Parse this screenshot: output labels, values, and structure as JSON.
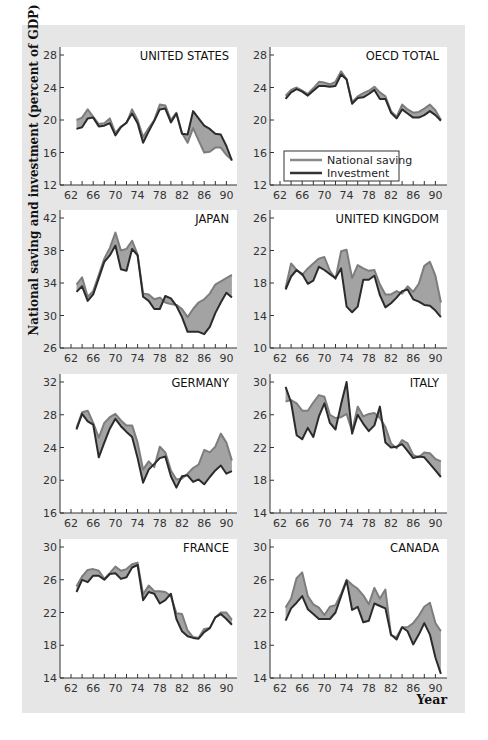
{
  "chart_data": {
    "type": "line",
    "subtype": "small-multiples-band",
    "ylabel": "National saving and investment (percent of GDP)",
    "xlabel": "Year",
    "legend": {
      "entries": [
        {
          "name": "National saving",
          "color": "#8a8a8a"
        },
        {
          "name": "Investment",
          "color": "#333333"
        }
      ],
      "panel": "OECD TOTAL"
    },
    "colors": {
      "band_fill": "#a3a3a3",
      "saving_line": "#7d7d7d",
      "investment_line": "#2b2b2b",
      "background": "#e6e6e6",
      "plot_bg": "#ffffff"
    },
    "x": [
      63,
      64,
      65,
      66,
      67,
      68,
      69,
      70,
      71,
      72,
      73,
      74,
      75,
      76,
      77,
      78,
      79,
      80,
      81,
      82,
      83,
      84,
      85,
      86,
      87,
      88,
      89,
      90,
      91
    ],
    "x_ticks": [
      "62",
      "66",
      "70",
      "74",
      "78",
      "82",
      "86",
      "90"
    ],
    "panels": [
      {
        "title": "UNITED STATES",
        "ylim": [
          12,
          28
        ],
        "yticks": [
          12,
          16,
          20,
          24,
          28
        ],
        "series": [
          {
            "name": "National saving",
            "values": [
              20.0,
              20.3,
              21.3,
              20.4,
              19.5,
              19.6,
              20.2,
              18.4,
              19.2,
              19.6,
              21.3,
              20.0,
              17.9,
              19.0,
              20.0,
              21.9,
              21.8,
              20.0,
              20.9,
              18.4,
              17.2,
              19.0,
              17.5,
              16.0,
              16.1,
              16.6,
              16.6,
              15.7,
              15.1
            ]
          },
          {
            "name": "Investment",
            "values": [
              18.9,
              19.1,
              20.2,
              20.3,
              19.2,
              19.3,
              19.6,
              18.1,
              19.1,
              19.7,
              20.8,
              19.6,
              17.2,
              18.6,
              19.9,
              21.3,
              21.4,
              19.7,
              20.8,
              18.3,
              18.2,
              21.1,
              20.2,
              19.3,
              18.9,
              18.3,
              18.2,
              16.8,
              15.0
            ]
          }
        ]
      },
      {
        "title": "OECD TOTAL",
        "ylim": [
          12,
          28
        ],
        "yticks": [
          12,
          16,
          20,
          24,
          28
        ],
        "series": [
          {
            "name": "National saving",
            "values": [
              23.0,
              23.7,
              24.0,
              23.6,
              23.2,
              23.9,
              24.7,
              24.6,
              24.4,
              24.7,
              26.0,
              25.0,
              22.2,
              22.9,
              23.3,
              23.6,
              24.1,
              23.4,
              22.9,
              21.1,
              20.4,
              21.9,
              21.3,
              20.9,
              21.0,
              21.4,
              21.9,
              21.2,
              20.0
            ]
          },
          {
            "name": "Investment",
            "values": [
              22.6,
              23.4,
              23.8,
              23.5,
              23.0,
              23.6,
              24.2,
              24.2,
              24.1,
              24.2,
              25.6,
              25.0,
              22.0,
              22.7,
              22.8,
              23.2,
              23.7,
              22.6,
              22.6,
              20.9,
              20.2,
              21.3,
              20.8,
              20.3,
              20.3,
              20.6,
              21.1,
              20.6,
              19.9
            ]
          }
        ]
      },
      {
        "title": "JAPAN",
        "ylim": [
          26,
          42
        ],
        "yticks": [
          26,
          30,
          34,
          38,
          42
        ],
        "series": [
          {
            "name": "National saving",
            "values": [
              33.8,
              34.7,
              32.3,
              33.0,
              35.0,
              37.0,
              38.3,
              40.2,
              38.0,
              38.2,
              39.2,
              37.5,
              32.7,
              32.6,
              32.0,
              32.2,
              31.6,
              31.4,
              31.3,
              30.8,
              29.8,
              30.8,
              31.6,
              32.0,
              32.7,
              33.8,
              34.2,
              34.6,
              35.0
            ]
          },
          {
            "name": "Investment",
            "values": [
              32.9,
              33.6,
              31.8,
              32.6,
              34.6,
              36.6,
              37.4,
              38.6,
              35.7,
              35.5,
              38.2,
              37.4,
              32.3,
              31.8,
              30.8,
              30.8,
              32.4,
              32.1,
              31.2,
              29.8,
              28.0,
              28.0,
              28.0,
              27.7,
              28.6,
              30.3,
              31.6,
              32.8,
              32.2
            ]
          }
        ]
      },
      {
        "title": "UNITED KINGDOM",
        "ylim": [
          10,
          26
        ],
        "yticks": [
          10,
          14,
          18,
          22,
          26
        ],
        "series": [
          {
            "name": "National saving",
            "values": [
              17.4,
              20.4,
              19.6,
              19.0,
              19.8,
              20.4,
              21.0,
              21.2,
              19.5,
              18.5,
              21.9,
              22.1,
              18.6,
              20.2,
              19.8,
              19.5,
              19.6,
              17.8,
              16.6,
              16.6,
              17.0,
              16.7,
              17.6,
              16.9,
              17.9,
              20.1,
              20.6,
              18.9,
              15.6
            ]
          },
          {
            "name": "Investment",
            "values": [
              17.2,
              18.8,
              19.6,
              19.1,
              17.9,
              18.3,
              20.0,
              19.6,
              19.1,
              18.6,
              19.8,
              15.1,
              14.4,
              15.1,
              18.4,
              18.4,
              18.9,
              16.5,
              15.0,
              15.5,
              16.2,
              17.0,
              17.2,
              16.0,
              15.7,
              15.3,
              15.2,
              14.6,
              13.8
            ]
          }
        ]
      },
      {
        "title": "GERMANY",
        "ylim": [
          16,
          32
        ],
        "yticks": [
          16,
          20,
          24,
          28,
          32
        ],
        "series": [
          {
            "name": "National saving",
            "values": [
              26.4,
              28.3,
              28.5,
              27.0,
              25.2,
              27.0,
              27.7,
              28.1,
              27.3,
              26.7,
              26.7,
              24.6,
              21.3,
              22.3,
              21.6,
              24.1,
              23.4,
              21.2,
              20.1,
              20.2,
              20.8,
              21.5,
              21.9,
              23.7,
              23.4,
              24.1,
              25.7,
              24.6,
              22.4
            ]
          },
          {
            "name": "Investment",
            "values": [
              26.2,
              28.1,
              27.2,
              26.8,
              22.8,
              24.6,
              26.3,
              27.5,
              26.6,
              25.9,
              25.3,
              22.7,
              19.7,
              21.3,
              22.0,
              22.7,
              22.9,
              20.5,
              19.1,
              20.5,
              20.6,
              19.8,
              20.1,
              19.5,
              20.4,
              21.2,
              21.8,
              20.8,
              21.1
            ]
          }
        ]
      },
      {
        "title": "ITALY",
        "ylim": [
          14,
          30
        ],
        "yticks": [
          14,
          18,
          22,
          26,
          30
        ],
        "series": [
          {
            "name": "National saving",
            "values": [
              27.6,
              27.8,
              27.4,
              26.5,
              26.5,
              27.5,
              28.4,
              28.2,
              26.0,
              25.6,
              25.7,
              26.1,
              24.0,
              27.0,
              25.8,
              26.1,
              26.2,
              25.6,
              24.5,
              22.5,
              21.9,
              22.9,
              22.5,
              21.1,
              20.8,
              21.4,
              21.3,
              20.6,
              20.3
            ]
          },
          {
            "name": "Investment",
            "values": [
              29.4,
              27.5,
              23.5,
              23.0,
              24.4,
              23.3,
              25.8,
              27.4,
              25.0,
              24.2,
              27.3,
              30.0,
              23.7,
              26.0,
              24.9,
              24.0,
              24.7,
              27.0,
              22.6,
              22.0,
              22.1,
              22.4,
              21.6,
              20.7,
              20.9,
              20.8,
              20.0,
              19.2,
              18.4
            ]
          }
        ]
      },
      {
        "title": "FRANCE",
        "ylim": [
          14,
          30
        ],
        "yticks": [
          14,
          18,
          22,
          26,
          30
        ],
        "series": [
          {
            "name": "National saving",
            "values": [
              25.2,
              26.4,
              27.2,
              27.3,
              27.1,
              26.1,
              26.8,
              27.6,
              27.1,
              27.3,
              27.9,
              28.1,
              24.2,
              25.3,
              24.6,
              24.6,
              24.5,
              24.0,
              21.9,
              21.8,
              19.8,
              19.0,
              18.9,
              20.0,
              20.1,
              21.4,
              22.0,
              22.0,
              21.1
            ]
          },
          {
            "name": "Investment",
            "values": [
              24.5,
              26.0,
              25.7,
              26.5,
              26.5,
              26.0,
              26.7,
              26.8,
              26.1,
              26.3,
              27.5,
              27.8,
              23.5,
              24.5,
              24.3,
              23.1,
              23.5,
              24.3,
              21.2,
              19.7,
              19.1,
              18.9,
              18.8,
              19.6,
              20.1,
              21.4,
              21.8,
              21.2,
              20.5
            ]
          }
        ]
      },
      {
        "title": "CANADA",
        "ylim": [
          14,
          30
        ],
        "yticks": [
          14,
          18,
          22,
          26,
          30
        ],
        "series": [
          {
            "name": "National saving",
            "values": [
              22.6,
              23.7,
              26.2,
              26.9,
              24.0,
              23.0,
              22.6,
              21.7,
              22.7,
              22.9,
              24.3,
              26.0,
              25.4,
              24.9,
              24.1,
              23.0,
              25.0,
              23.7,
              24.8,
              19.2,
              19.0,
              20.2,
              20.2,
              20.7,
              21.6,
              22.7,
              23.2,
              20.7,
              19.7
            ]
          },
          {
            "name": "Investment",
            "values": [
              21.0,
              22.5,
              23.2,
              24.0,
              22.4,
              21.8,
              21.2,
              21.2,
              21.2,
              22.0,
              24.0,
              25.9,
              22.3,
              22.7,
              20.8,
              21.0,
              23.1,
              22.8,
              22.5,
              19.3,
              18.7,
              20.2,
              19.7,
              18.1,
              19.3,
              20.7,
              19.3,
              16.5,
              14.5
            ]
          }
        ]
      }
    ],
    "layout": {
      "rows": 4,
      "cols": 2,
      "legend_position": "inside OECD TOTAL panel, lower-left",
      "grid": false
    }
  }
}
